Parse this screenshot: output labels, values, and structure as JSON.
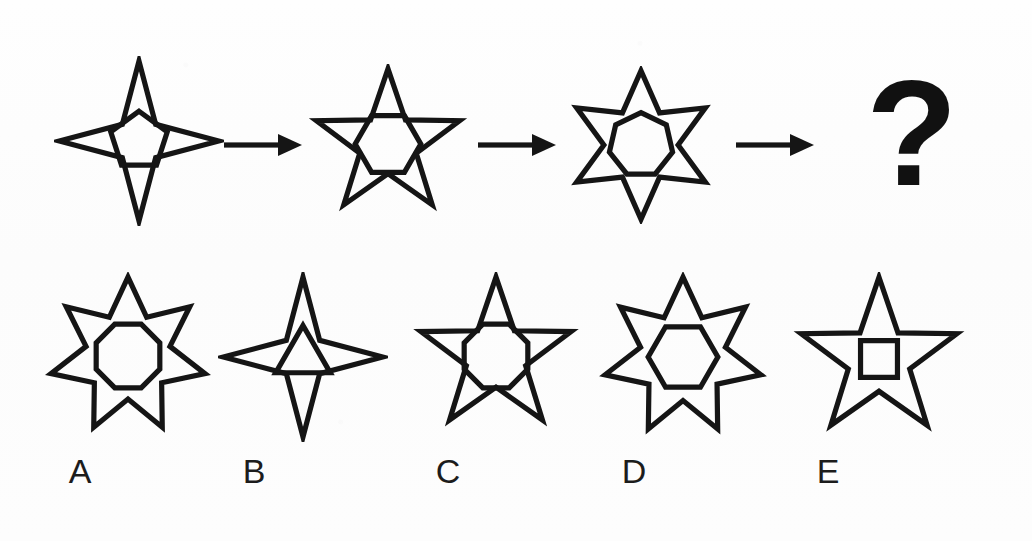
{
  "puzzle": {
    "type": "visual-analogy-sequence",
    "background_color": "#fdfdfd",
    "ink_color": "#151515",
    "sequence": {
      "items": [
        {
          "id": "seq-1",
          "outer_shape": "star",
          "outer_points": 4,
          "inner_shape": "pentagon",
          "inner_sides": 5,
          "x": 54,
          "y": 12,
          "size": 170
        },
        {
          "id": "seq-2",
          "outer_shape": "star",
          "outer_points": 5,
          "inner_shape": "hexagon",
          "inner_sides": 6,
          "x": 308,
          "y": 20,
          "size": 160
        },
        {
          "id": "seq-3",
          "outer_shape": "star",
          "outer_points": 6,
          "inner_shape": "heptagon",
          "inner_sides": 7,
          "x": 562,
          "y": 22,
          "size": 158
        }
      ],
      "arrows": [
        {
          "id": "arrow-1",
          "x": 224,
          "y": 88,
          "length": 78
        },
        {
          "id": "arrow-2",
          "x": 478,
          "y": 88,
          "length": 78
        },
        {
          "id": "arrow-3",
          "x": 736,
          "y": 88,
          "length": 78
        }
      ],
      "unknown": {
        "id": "unknown-slot",
        "glyph": "?",
        "x": 866,
        "y": 14
      }
    },
    "options": {
      "items": [
        {
          "id": "option-a",
          "label": "A",
          "outer_shape": "star",
          "outer_points": 7,
          "inner_shape": "octagon",
          "inner_sides": 8,
          "x": 44,
          "size": 168,
          "label_x": 80
        },
        {
          "id": "option-b",
          "label": "B",
          "outer_shape": "star",
          "outer_points": 4,
          "inner_shape": "triangle",
          "inner_sides": 3,
          "x": 218,
          "size": 170,
          "label_x": 254
        },
        {
          "id": "option-c",
          "label": "C",
          "outer_shape": "star",
          "outer_points": 5,
          "inner_shape": "octagon",
          "inner_sides": 8,
          "x": 412,
          "size": 168,
          "label_x": 448
        },
        {
          "id": "option-d",
          "label": "D",
          "outer_shape": "star",
          "outer_points": 7,
          "inner_shape": "hexagon",
          "inner_sides": 6,
          "x": 598,
          "size": 170,
          "label_x": 634
        },
        {
          "id": "option-e",
          "label": "E",
          "outer_shape": "star",
          "outer_points": 5,
          "inner_shape": "square",
          "inner_sides": 4,
          "x": 792,
          "size": 174,
          "label_x": 828
        }
      ]
    }
  }
}
